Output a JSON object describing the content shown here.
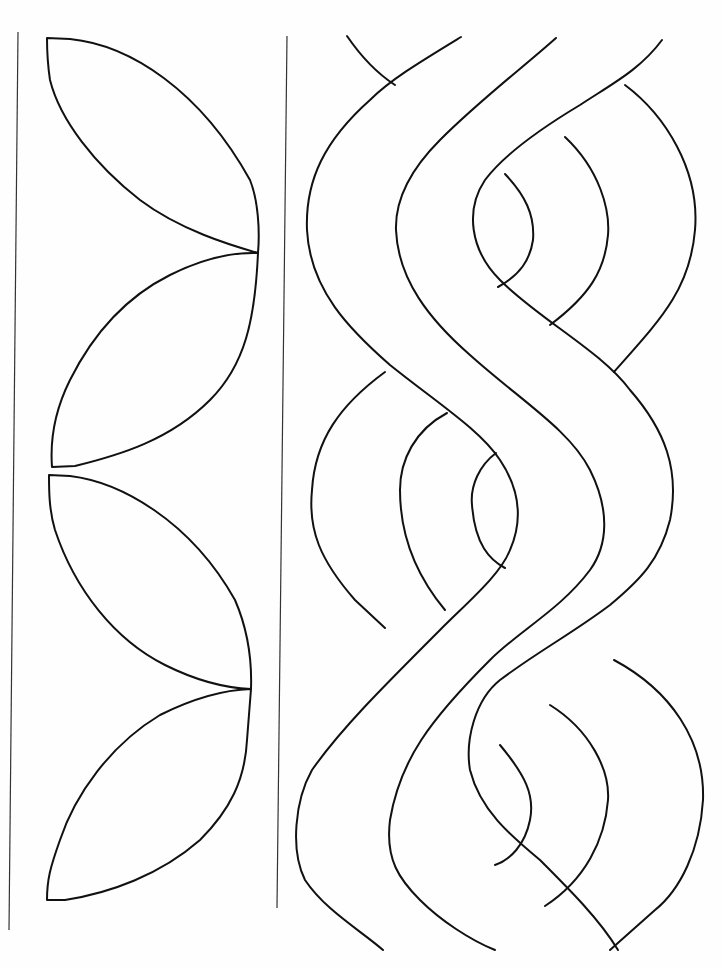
{
  "drawing": {
    "title": "Quilting border patterns",
    "left_panel": {
      "motif": "leaf-petals",
      "count": 4
    },
    "right_panel": {
      "motif": "cable-braid",
      "strands": 3
    },
    "stroke_color": "#111111",
    "background_color": "#fefefe"
  }
}
